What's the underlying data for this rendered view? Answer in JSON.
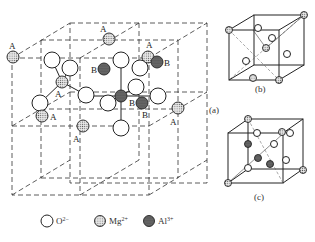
{
  "figure": {
    "panels": [
      {
        "id": "a",
        "label": "(a)",
        "description": "Spinel unit cell subdivided into octants"
      },
      {
        "id": "b",
        "label": "(b)",
        "description": "Octant with tetrahedral A site"
      },
      {
        "id": "c",
        "label": "(c)",
        "description": "Octant with octahedral B sites"
      }
    ],
    "site_labels": {
      "a": "A",
      "b": "B"
    },
    "legend": [
      {
        "symbol": "open-circle",
        "ion": "O",
        "charge": "2−"
      },
      {
        "symbol": "dotted-circle",
        "ion": "Mg",
        "charge": "2+"
      },
      {
        "symbol": "dense-circle",
        "ion": "Al",
        "charge": "3+"
      }
    ],
    "colors": {
      "line": "#222222",
      "background": "#ffffff",
      "mg_fill": "#bdbdbd",
      "al_fill": "#555555"
    }
  }
}
